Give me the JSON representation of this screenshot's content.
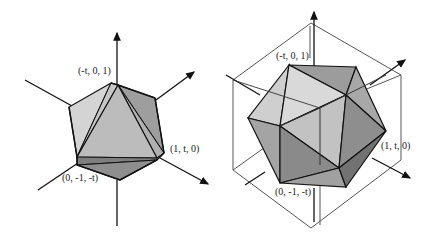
{
  "figures": [
    {
      "id": "left",
      "description": "Icosahedron with inscribed octahedron-like triangles and coordinate axes",
      "labels": {
        "top": "(-t, 0, 1)",
        "right": "(1, t, 0)",
        "bottom": "(0, -1, -t)"
      }
    },
    {
      "id": "right",
      "description": "Icosahedron inscribed in a cube with coordinate axes",
      "labels": {
        "top": "(-t, 0, 1)",
        "right": "(1, t, 0)",
        "bottom": "(0, -1, -t)"
      }
    }
  ],
  "colors": {
    "stroke": "#111111",
    "face_light": "#d6d6d6",
    "face_mid": "#b4b4b4",
    "face_dark": "#8e8e8e",
    "cube_line": "#555555"
  }
}
